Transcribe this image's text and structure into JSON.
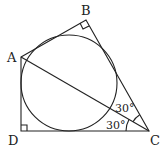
{
  "diagram": {
    "type": "geometry",
    "vertices": {
      "A": {
        "label": "A"
      },
      "B": {
        "label": "B"
      },
      "C": {
        "label": "C"
      },
      "D": {
        "label": "D"
      }
    },
    "angles": {
      "BCA": "30°",
      "ACD": "30°"
    },
    "right_angles": [
      "B",
      "D"
    ],
    "elements": [
      "quadrilateral ABCD",
      "inscribed circle",
      "segment AC"
    ]
  }
}
